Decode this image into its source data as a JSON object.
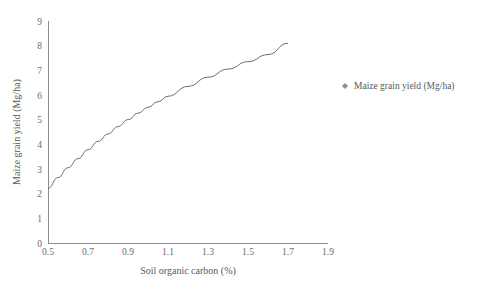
{
  "chart_data": {
    "type": "scatter",
    "title": "",
    "xlabel": "Soil organic carbon (%)",
    "ylabel": "Maize grain yield (Mg/ha)",
    "xlim": [
      0.5,
      1.9
    ],
    "ylim": [
      0,
      9
    ],
    "xticks": [
      "0.5",
      "0.7",
      "0.9",
      "1.1",
      "1.3",
      "1.5",
      "1.7",
      "1.9"
    ],
    "xtick_values": [
      0.5,
      0.7,
      0.9,
      1.1,
      1.3,
      1.5,
      1.7,
      1.9
    ],
    "yticks": [
      "0",
      "1",
      "2",
      "3",
      "4",
      "5",
      "6",
      "7",
      "8",
      "9"
    ],
    "ytick_values": [
      0,
      1,
      2,
      3,
      4,
      5,
      6,
      7,
      8,
      9
    ],
    "grid": false,
    "legend_position": "right",
    "marker_shape": "diamond",
    "marker_color": "#8f8f8f",
    "curve_color": "#6f6f6f",
    "axis_color": "#8d8d8d",
    "series": [
      {
        "name": "Maize grain yield (Mg/ha)",
        "points": [
          [
            0.5,
            2.22
          ],
          [
            0.51,
            2.18
          ],
          [
            0.52,
            3.12
          ],
          [
            0.52,
            2.6
          ],
          [
            0.58,
            1.89
          ],
          [
            0.62,
            3.96
          ],
          [
            0.63,
            3.25
          ],
          [
            0.63,
            2.78
          ],
          [
            0.65,
            2.85
          ],
          [
            0.66,
            2.87
          ],
          [
            0.67,
            3.9
          ],
          [
            0.7,
            3.88
          ],
          [
            0.78,
            4.2
          ],
          [
            0.89,
            5.48
          ],
          [
            0.89,
            3.87
          ],
          [
            0.96,
            5.88
          ],
          [
            0.96,
            4.27
          ],
          [
            1.05,
            7.52
          ],
          [
            1.1,
            7.52
          ],
          [
            1.43,
            7.52
          ],
          [
            1.49,
            5.87
          ],
          [
            1.65,
            7.42
          ],
          [
            1.7,
            8.1
          ]
        ]
      }
    ],
    "trend_curve": {
      "description": "logarithmic fit through scatter",
      "points": [
        [
          0.5,
          2.22
        ],
        [
          0.55,
          2.65
        ],
        [
          0.6,
          3.05
        ],
        [
          0.65,
          3.42
        ],
        [
          0.7,
          3.78
        ],
        [
          0.75,
          4.12
        ],
        [
          0.8,
          4.42
        ],
        [
          0.85,
          4.72
        ],
        [
          0.9,
          5.0
        ],
        [
          0.95,
          5.26
        ],
        [
          1.0,
          5.5
        ],
        [
          1.05,
          5.73
        ],
        [
          1.1,
          5.95
        ],
        [
          1.2,
          6.35
        ],
        [
          1.3,
          6.72
        ],
        [
          1.4,
          7.05
        ],
        [
          1.5,
          7.35
        ],
        [
          1.6,
          7.64
        ],
        [
          1.7,
          8.1
        ]
      ]
    }
  },
  "legend": {
    "entries": [
      {
        "label": "Maize grain yield (Mg/ha)",
        "color": "#8f8f8f"
      }
    ]
  }
}
